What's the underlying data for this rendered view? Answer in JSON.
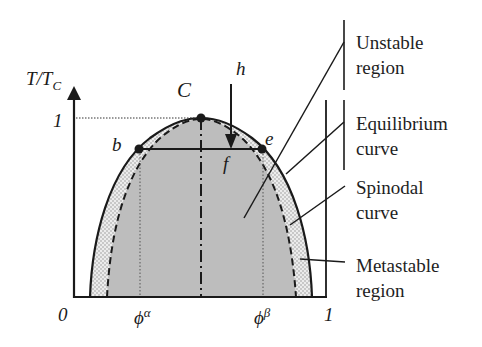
{
  "diagram": {
    "type": "phase-diagram",
    "axes": {
      "y_label": "T/T",
      "y_label_sub": "C",
      "y_tick": "1",
      "x_origin": "0",
      "x_end": "1",
      "x_tick_alpha": "ϕ",
      "x_tick_alpha_sup": "α",
      "x_tick_beta": "ϕ",
      "x_tick_beta_sup": "β"
    },
    "points": {
      "critical": "C",
      "b": "b",
      "e": "e",
      "f": "f",
      "h": "h"
    },
    "legend": [
      {
        "line1": "Unstable",
        "line2": "region"
      },
      {
        "line1": "Equilibrium",
        "line2": "curve"
      },
      {
        "line1": "Spinodal",
        "line2": "curve"
      },
      {
        "line1": "Metastable",
        "line2": "region"
      }
    ],
    "colors": {
      "unstable_fill": "#bdbdbd",
      "metastable_fill": "#e8e8e8",
      "line": "#1a1a1a"
    }
  }
}
